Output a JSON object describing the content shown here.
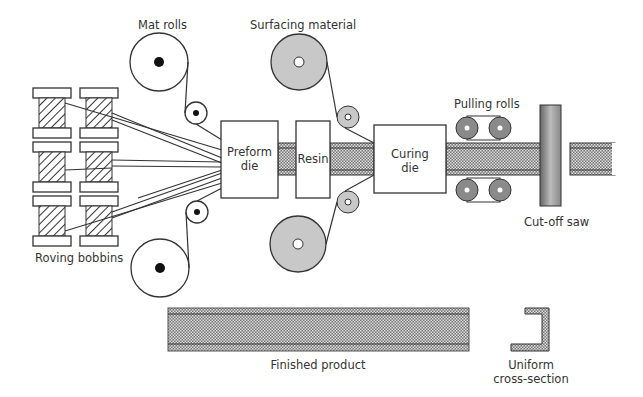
{
  "labels": {
    "mat_rolls": "Mat rolls",
    "surfacing_material": "Surfacing material",
    "pulling_rolls": "Pulling rolls",
    "preform_die_1": "Preform",
    "preform_die_2": "die",
    "resin": "Resin",
    "curing_die_1": "Curing",
    "curing_die_2": "die",
    "roving_bobbins": "Roving bobbins",
    "cut_off_saw": "Cut-off saw",
    "finished_product": "Finished product",
    "cross_section_1": "Uniform",
    "cross_section_2": "cross-section"
  },
  "colors": {
    "stroke": "#333333",
    "roll_fill": "#c8c8c8",
    "pull_roll_fill": "#8a8a8a",
    "composite_dark": "#555555"
  }
}
